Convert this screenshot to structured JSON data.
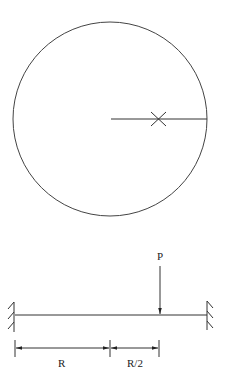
{
  "figure": {
    "circle": {
      "cx": 110,
      "cy": 119,
      "r": 97,
      "stroke": "#444444"
    },
    "radius_line": {
      "x1": 111,
      "x2": 207,
      "y": 119
    },
    "marker": {
      "x": 158,
      "y": 119,
      "symbol": "X"
    },
    "beam": {
      "x1": 15,
      "x2": 207,
      "y": 315
    },
    "load": {
      "label": "P",
      "x": 160,
      "y_top": 266,
      "y_bottom": 315
    },
    "dimensions": [
      {
        "label": "R",
        "x1": 15,
        "x2": 110
      },
      {
        "label": "R/2",
        "x1": 110,
        "x2": 159
      }
    ],
    "supports": [
      "fixed-left",
      "fixed-right"
    ]
  }
}
